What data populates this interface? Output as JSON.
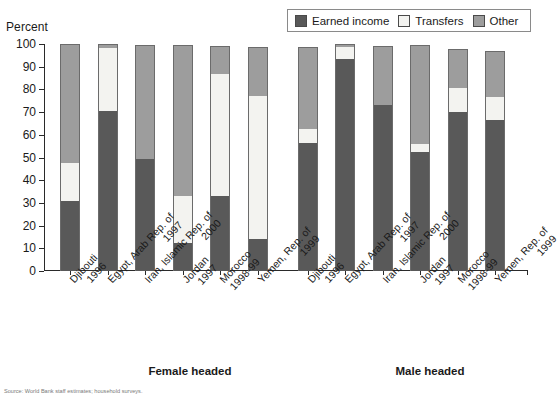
{
  "axis": {
    "y_title": "Percent",
    "y_ticks": [
      "0",
      "10",
      "20",
      "30",
      "40",
      "50",
      "60",
      "70",
      "80",
      "90",
      "100"
    ]
  },
  "legend": {
    "items": [
      {
        "label": "Earned income",
        "swatch": "legend-swatch-earned-income",
        "color": "#595959"
      },
      {
        "label": "Transfers",
        "swatch": "legend-swatch-transfers",
        "color": "#f3f3f0"
      },
      {
        "label": "Other",
        "swatch": "legend-swatch-other",
        "color": "#9d9d9d"
      }
    ]
  },
  "groups": [
    {
      "caption": "Female headed"
    },
    {
      "caption": "Male headed"
    }
  ],
  "source": "Source: World Bank staff estimates; household surveys.",
  "chart_data": {
    "type": "bar",
    "stacked": true,
    "title": "",
    "xlabel": "",
    "ylabel": "Percent",
    "ylim": [
      0,
      100
    ],
    "grid": false,
    "legend_position": "top-right",
    "series": [
      {
        "name": "Earned income",
        "color": "#595959"
      },
      {
        "name": "Transfers",
        "color": "#f3f3f0"
      },
      {
        "name": "Other",
        "color": "#9d9d9d"
      }
    ],
    "panels": [
      {
        "name": "Female headed",
        "categories": [
          {
            "country": "Djibouti",
            "year": "1996",
            "earned_income": 31.0,
            "transfers": 17.0,
            "other": 52.0,
            "total": 100.0
          },
          {
            "country": "Egypt, Arab Rep. of",
            "year": "1997",
            "earned_income": 71.0,
            "transfers": 27.5,
            "other": 1.5,
            "total": 100.0
          },
          {
            "country": "Iran, Islamic Rep. of",
            "year": "2000",
            "earned_income": 49.5,
            "transfers": 0.0,
            "other": 50.0,
            "total": 99.5
          },
          {
            "country": "Jordan",
            "year": "1997",
            "earned_income": 12.5,
            "transfers": 20.5,
            "other": 66.5,
            "total": 99.5
          },
          {
            "country": "Morocco",
            "year": "1998-99",
            "earned_income": 33.3,
            "transfers": 53.7,
            "other": 12.0,
            "total": 99.0
          },
          {
            "country": "Yemen, Rep. of",
            "year": "1999",
            "earned_income": 14.0,
            "transfers": 63.5,
            "other": 21.0,
            "total": 98.5
          }
        ]
      },
      {
        "name": "Male headed",
        "categories": [
          {
            "country": "Djibouti",
            "year": "1996",
            "earned_income": 56.5,
            "transfers": 6.5,
            "other": 35.5,
            "total": 98.5
          },
          {
            "country": "Egypt, Arab Rep. of",
            "year": "1997",
            "earned_income": 94.0,
            "transfers": 5.0,
            "other": 1.0,
            "total": 100.0
          },
          {
            "country": "Iran, Islamic Rep. of",
            "year": "2000",
            "earned_income": 73.5,
            "transfers": 0.0,
            "other": 25.5,
            "total": 99.0
          },
          {
            "country": "Jordan",
            "year": "1997",
            "earned_income": 52.5,
            "transfers": 3.5,
            "other": 43.5,
            "total": 99.5
          },
          {
            "country": "Morocco",
            "year": "1998-99",
            "earned_income": 70.5,
            "transfers": 10.5,
            "other": 17.0,
            "total": 98.0
          },
          {
            "country": "Yemen, Rep. of",
            "year": "1999",
            "earned_income": 67.0,
            "transfers": 10.0,
            "other": 20.0,
            "total": 97.0
          }
        ]
      }
    ]
  }
}
